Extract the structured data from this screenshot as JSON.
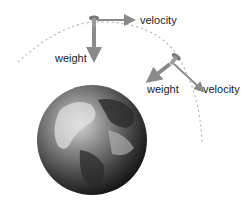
{
  "labels": {
    "velocity_top": "velocity",
    "weight_top": "weight",
    "weight_right": "weight",
    "velocity_right": "velocity"
  },
  "colors": {
    "arrow": "#8a8a8a",
    "orbit": "#b5b5b5",
    "text": "#222222"
  }
}
